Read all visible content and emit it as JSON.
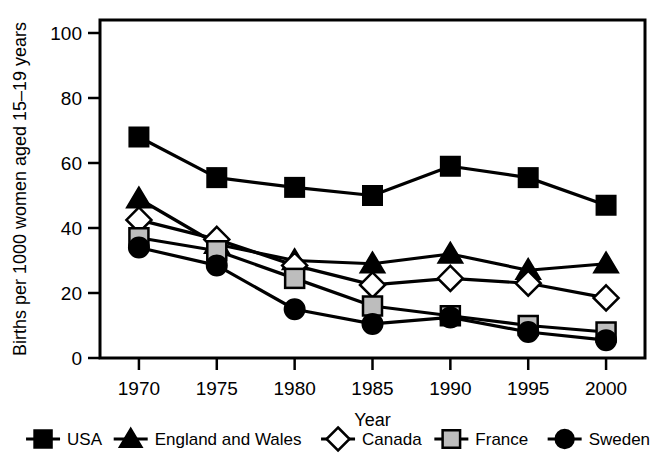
{
  "chart_data": {
    "type": "line",
    "title": "",
    "xlabel": "Year",
    "ylabel": "Births per 1000 women aged 15–19 years",
    "x": [
      1970,
      1975,
      1980,
      1985,
      1990,
      1995,
      2000
    ],
    "xtick_labels": [
      "1970",
      "1975",
      "1980",
      "1985",
      "1990",
      "1995",
      "2000"
    ],
    "ytick_labels": [
      "0",
      "20",
      "40",
      "60",
      "80",
      "100"
    ],
    "yticks": [
      0,
      20,
      40,
      60,
      80,
      100
    ],
    "ylim": [
      0,
      104
    ],
    "xlim": [
      1967.5,
      2002.5
    ],
    "grid": false,
    "legend_position": "below",
    "series": [
      {
        "name": "USA",
        "marker": "filled-square",
        "color": "#000000",
        "values": [
          68,
          55.5,
          52.5,
          50,
          59,
          55.5,
          47
        ]
      },
      {
        "name": "England and Wales",
        "marker": "filled-triangle",
        "color": "#000000",
        "values": [
          49,
          35,
          30,
          29,
          32,
          27,
          29
        ]
      },
      {
        "name": "Canada",
        "marker": "open-diamond",
        "color": "#000000",
        "values": [
          42.5,
          36.5,
          28.5,
          22.5,
          24.5,
          23,
          18.5
        ]
      },
      {
        "name": "France",
        "marker": "gray-square",
        "color": "#b8b8b8",
        "values": [
          37,
          33,
          24.5,
          16,
          13,
          10,
          8
        ]
      },
      {
        "name": "Sweden",
        "marker": "filled-circle",
        "color": "#000000",
        "values": [
          34,
          28.5,
          15,
          10.5,
          12.5,
          8,
          5.5
        ]
      }
    ]
  },
  "legend": {
    "items": [
      {
        "label": "USA",
        "marker": "filled-square"
      },
      {
        "label": "England and Wales",
        "marker": "filled-triangle"
      },
      {
        "label": "Canada",
        "marker": "open-diamond"
      },
      {
        "label": "France",
        "marker": "gray-square"
      },
      {
        "label": "Sweden",
        "marker": "filled-circle"
      }
    ]
  },
  "style": {
    "line_color": "#000000",
    "france_fill": "#bdbdbd",
    "background": "#ffffff",
    "axis_color": "#000000"
  }
}
